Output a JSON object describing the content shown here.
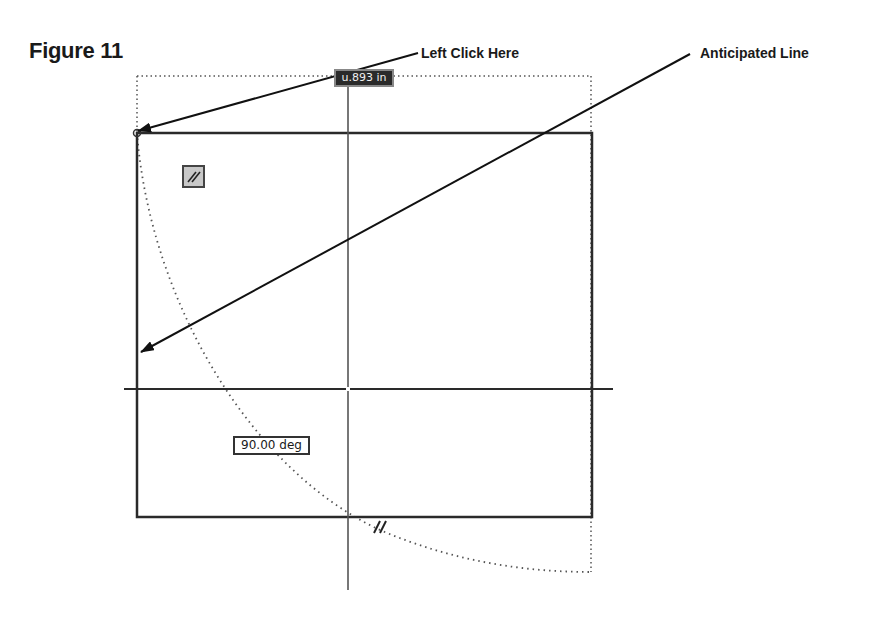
{
  "figure": {
    "title": "Figure 11"
  },
  "callouts": {
    "left_click": "Left Click Here",
    "anticipated": "Anticipated Line"
  },
  "sketch": {
    "dimension_label": "u.893 in",
    "angle_label": "90.00 deg",
    "constraint_icon": "parallel-constraint-icon",
    "parallel_glyph": "//",
    "colors": {
      "line": "#2a2a2a",
      "dotted": "#555555",
      "dim_bg": "#2a2a2a",
      "dim_text": "#f0f0f0"
    }
  }
}
